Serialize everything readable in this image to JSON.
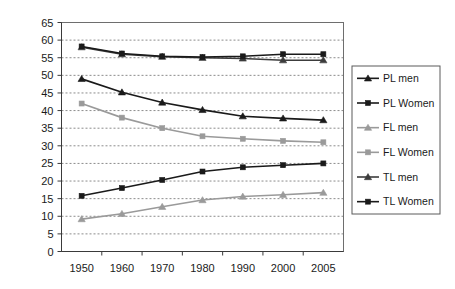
{
  "chart_data": {
    "type": "line",
    "title": "",
    "xlabel": "",
    "ylabel": "",
    "x": [
      1950,
      1960,
      1970,
      1980,
      1990,
      2000,
      2005
    ],
    "categories": [
      "1950",
      "1960",
      "1970",
      "1980",
      "1990",
      "2000",
      "2005"
    ],
    "ylim": [
      0,
      65
    ],
    "ytick_step": 5,
    "yticks": [
      0,
      5,
      10,
      15,
      20,
      25,
      30,
      35,
      40,
      45,
      50,
      55,
      60,
      65
    ],
    "ytick_labels": [
      "0",
      "5",
      "10",
      "15",
      "20",
      "25",
      "30",
      "35",
      "40",
      "45",
      "50",
      "55",
      "60",
      "65"
    ],
    "grid": true,
    "grid_orientation": "horizontal",
    "grid_style": "dashed",
    "legend_position": "right",
    "series": [
      {
        "name": "PL men",
        "color": "#1a1a1a",
        "marker": "triangle",
        "values": [
          49.0,
          45.2,
          42.3,
          40.2,
          38.4,
          37.8,
          37.3
        ]
      },
      {
        "name": "PL Women",
        "color": "#1a1a1a",
        "marker": "square",
        "values": [
          15.8,
          18.0,
          20.3,
          22.7,
          23.9,
          24.5,
          25.0
        ]
      },
      {
        "name": "FL men",
        "color": "#9a9a9a",
        "marker": "triangle",
        "values": [
          9.2,
          10.7,
          12.7,
          14.6,
          15.6,
          16.1,
          16.7
        ]
      },
      {
        "name": "FL Women",
        "color": "#9a9a9a",
        "marker": "square",
        "values": [
          42.0,
          38.0,
          35.0,
          32.7,
          32.0,
          31.4,
          31.0
        ]
      },
      {
        "name": "TL men",
        "color": "#3c3c3c",
        "marker": "triangle",
        "values": [
          58.0,
          56.0,
          55.3,
          55.0,
          54.8,
          54.3,
          54.3
        ]
      },
      {
        "name": "TL Women",
        "color": "#1a1a1a",
        "marker": "square",
        "values": [
          58.2,
          56.2,
          55.4,
          55.2,
          55.4,
          56.0,
          56.0
        ]
      }
    ]
  },
  "legend": {
    "items": [
      {
        "label": "PL men"
      },
      {
        "label": "PL Women"
      },
      {
        "label": "FL men"
      },
      {
        "label": "FL Women"
      },
      {
        "label": "TL men"
      },
      {
        "label": "TL Women"
      }
    ]
  },
  "colors": {
    "dark": "#1a1a1a",
    "gray": "#9a9a9a",
    "axis": "#3a3a3a",
    "grid": "#8c8c8c",
    "frame": "#6e6e6e",
    "background": "#ffffff"
  }
}
